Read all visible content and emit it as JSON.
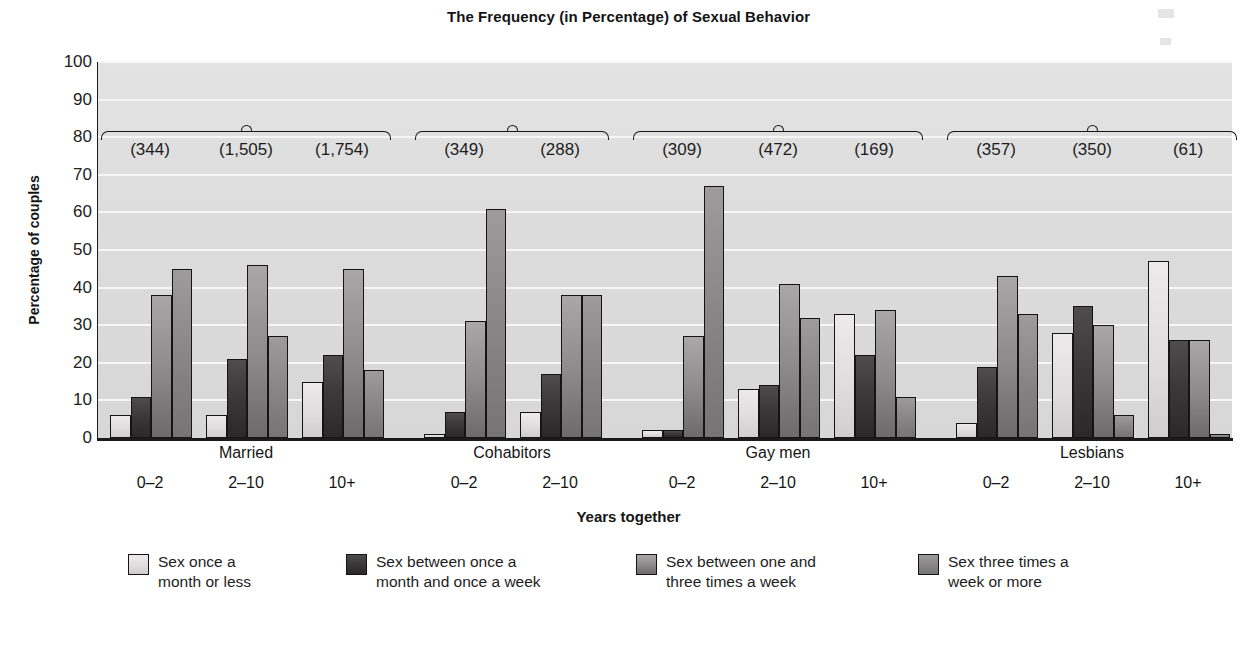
{
  "chart_data": {
    "type": "bar",
    "title": "The Frequency (in Percentage) of Sexual Behavior",
    "xlabel": "Years together",
    "ylabel": "Percentage of couples",
    "ylim": [
      0,
      100
    ],
    "ytick_values": [
      0,
      10,
      20,
      30,
      40,
      50,
      60,
      70,
      80,
      90,
      100
    ],
    "grid": true,
    "legend_position": "bottom",
    "legend": [
      "Sex once a month or less",
      "Sex between once a month and once a week",
      "Sex between one and three times a week",
      "Sex three times a week or more"
    ],
    "series": [
      {
        "name": "Sex once a month or less",
        "color": "#dedcdc",
        "values": [
          6,
          6,
          15,
          1,
          7,
          2,
          13,
          33,
          4,
          28,
          47
        ]
      },
      {
        "name": "Sex between once a month and once a week",
        "color": "#3b3939",
        "values": [
          11,
          21,
          22,
          7,
          17,
          2,
          14,
          22,
          19,
          35,
          26
        ]
      },
      {
        "name": "Sex between one and three times a week",
        "color": "#8e8c8c",
        "values": [
          38,
          46,
          45,
          31,
          38,
          27,
          41,
          34,
          43,
          30,
          26
        ]
      },
      {
        "name": "Sex three times a week or more",
        "color": "#868484",
        "values": [
          45,
          27,
          18,
          61,
          38,
          67,
          32,
          11,
          33,
          6,
          1
        ]
      }
    ],
    "groups": [
      {
        "name": "Married",
        "subgroups": [
          {
            "label": "0–2",
            "count": "(344)",
            "values": [
              6,
              11,
              38,
              45
            ]
          },
          {
            "label": "2–10",
            "count": "(1,505)",
            "values": [
              6,
              21,
              46,
              27
            ]
          },
          {
            "label": "10+",
            "count": "(1,754)",
            "values": [
              15,
              22,
              45,
              18
            ]
          }
        ]
      },
      {
        "name": "Cohabitors",
        "subgroups": [
          {
            "label": "0–2",
            "count": "(349)",
            "values": [
              1,
              7,
              31,
              61
            ]
          },
          {
            "label": "2–10",
            "count": "(288)",
            "values": [
              7,
              17,
              38,
              38
            ]
          }
        ]
      },
      {
        "name": "Gay men",
        "subgroups": [
          {
            "label": "0–2",
            "count": "(309)",
            "values": [
              2,
              2,
              27,
              67
            ]
          },
          {
            "label": "2–10",
            "count": "(472)",
            "values": [
              13,
              14,
              41,
              32
            ]
          },
          {
            "label": "10+",
            "count": "(169)",
            "values": [
              33,
              22,
              34,
              11
            ]
          }
        ]
      },
      {
        "name": "Lesbians",
        "subgroups": [
          {
            "label": "0–2",
            "count": "(357)",
            "values": [
              4,
              19,
              43,
              33
            ]
          },
          {
            "label": "2–10",
            "count": "(350)",
            "values": [
              28,
              35,
              30,
              6
            ]
          },
          {
            "label": "10+",
            "count": "(61)",
            "values": [
              47,
              26,
              26,
              1
            ]
          }
        ]
      }
    ]
  },
  "footnote": ""
}
